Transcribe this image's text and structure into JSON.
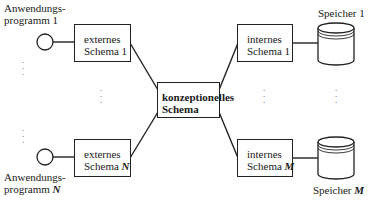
{
  "diagram": {
    "title": "",
    "applications": [
      {
        "line1": "Anwendungs-",
        "line2": "programm",
        "index": "1"
      },
      {
        "line1": "Anwendungs-",
        "line2": "programm",
        "index": "N"
      }
    ],
    "external_schemas": [
      {
        "line1": "externes",
        "line2": "Schema",
        "index": "1"
      },
      {
        "line1": "externes",
        "line2": "Schema",
        "index": "N"
      }
    ],
    "conceptual_schema": {
      "line1": "konzeptionelles",
      "line2": "Schema"
    },
    "internal_schemas": [
      {
        "line1": "internes",
        "line2": "Schema",
        "index": "1"
      },
      {
        "line1": "internes",
        "line2": "Schema",
        "index": "M"
      }
    ],
    "storages": [
      {
        "label": "Speicher",
        "index": "1"
      },
      {
        "label": "Speicher",
        "index": "M"
      }
    ],
    "ellipsis": ":",
    "colors": {
      "line": "#222222",
      "background": "#ffffff",
      "text": "#1a1a1a"
    }
  }
}
